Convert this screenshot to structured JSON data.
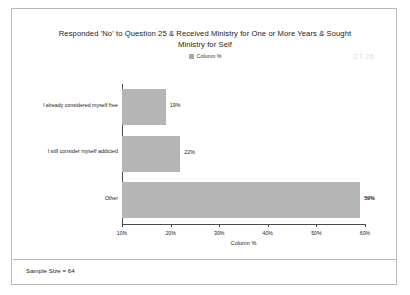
{
  "watermark": "CT-26",
  "footer": {
    "sample_size": "Sample Size = 64"
  },
  "legend": {
    "entries": [
      {
        "label": "Column %",
        "color": "#a8a8a8"
      }
    ]
  },
  "chart_data": {
    "type": "bar",
    "orientation": "horizontal",
    "title": "Responded 'No' to Question 25 & Received Ministry for One or More Years & Sought Ministry for Self",
    "title_line1": "Responded 'No' to Question 25 & Received Ministry for One or More Years & Sought",
    "title_line2": "Ministry for Self",
    "categories": [
      "I already considered myself free",
      "I still consider myself addicted",
      "Other"
    ],
    "values": [
      19,
      22,
      59
    ],
    "value_labels": [
      "19%",
      "22%",
      "59%"
    ],
    "series": [
      {
        "name": "Column %",
        "values": [
          19,
          22,
          59
        ]
      }
    ],
    "xlabel": "Column %",
    "ylabel": "",
    "xlim": [
      10,
      60
    ],
    "xticks": [
      10,
      20,
      30,
      40,
      50,
      60
    ],
    "xtick_labels": [
      "10%",
      "20%",
      "30%",
      "40%",
      "50%",
      "60%"
    ],
    "grid": false,
    "legend_position": "top-center",
    "bar_color": "#b5b5b5"
  }
}
